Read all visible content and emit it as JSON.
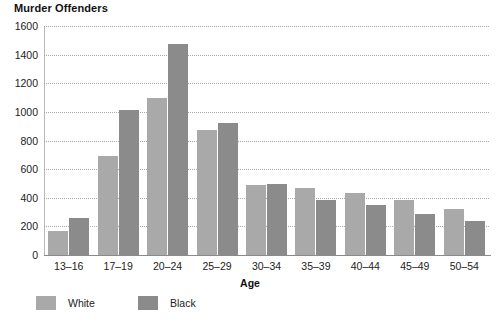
{
  "chart_data": {
    "type": "bar",
    "title": "Murder Offenders",
    "xlabel": "Age",
    "ylabel": "",
    "categories": [
      "13–16",
      "17–19",
      "20–24",
      "25–29",
      "30–34",
      "35–39",
      "40–44",
      "45–49",
      "50–54"
    ],
    "series": [
      {
        "name": "White",
        "color": "#a9a9a9",
        "values": [
          170,
          690,
          1095,
          870,
          490,
          470,
          435,
          385,
          320
        ]
      },
      {
        "name": "Black",
        "color": "#8b8b8b",
        "values": [
          260,
          1015,
          1475,
          925,
          495,
          385,
          350,
          285,
          235
        ]
      }
    ],
    "ylim": [
      0,
      1600
    ],
    "yticks": [
      0,
      200,
      400,
      600,
      800,
      1000,
      1200,
      1400,
      1600
    ],
    "ytick_labels": [
      "0",
      "200",
      "400",
      "600",
      "800",
      "1000",
      "1200",
      "1400",
      "1600"
    ],
    "grid": true,
    "grid_style": "dotted",
    "legend_position": "bottom-left",
    "legend": [
      "White",
      "Black"
    ]
  }
}
